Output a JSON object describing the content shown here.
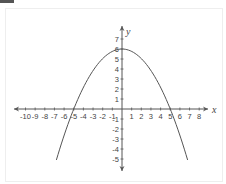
{
  "chart_data": {
    "type": "line",
    "title": "",
    "xlabel": "x",
    "ylabel": "y",
    "xlim": [
      -11,
      9
    ],
    "ylim": [
      -6,
      8
    ],
    "grid": false,
    "x_ticks": [
      -10,
      -9,
      -8,
      -7,
      -6,
      -5,
      -4,
      -3,
      -2,
      -1,
      1,
      2,
      3,
      4,
      5,
      6,
      7,
      8
    ],
    "y_ticks": [
      -5,
      -4,
      -3,
      -2,
      -1,
      1,
      2,
      3,
      4,
      5,
      6,
      7
    ],
    "series": [
      {
        "name": "parabola",
        "equation": "y = 6 - 0.24x^2",
        "vertex": [
          0,
          6
        ],
        "roots": [
          -5,
          5
        ],
        "x_range": [
          -6.8,
          6.8
        ],
        "color": "#555555"
      }
    ]
  },
  "axes": {
    "x_label": "x",
    "y_label": "y"
  },
  "colors": {
    "axis": "#555555",
    "curve": "#555555",
    "text": "#444444"
  }
}
